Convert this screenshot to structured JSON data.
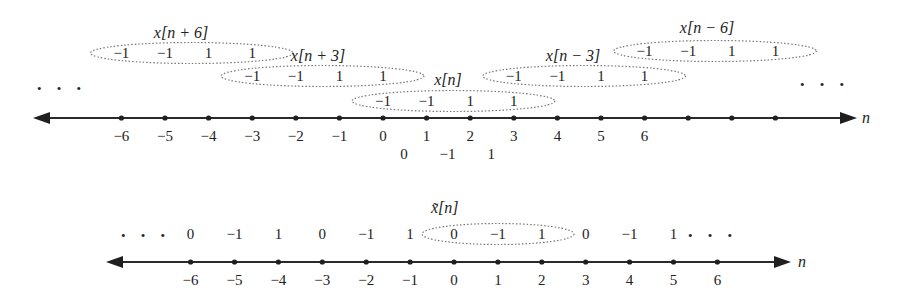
{
  "diagram": {
    "colors": {
      "ink": "#222222",
      "ellipse": "#777777",
      "background": "#ffffff"
    }
  },
  "top_axis": {
    "variable_label": "n",
    "tick_labels": [
      "−6",
      "−5",
      "−4",
      "−3",
      "−2",
      "−1",
      "0",
      "1",
      "2",
      "3",
      "4",
      "5",
      "6"
    ],
    "tick_values": [
      -6,
      -5,
      -4,
      -3,
      -2,
      -1,
      0,
      1,
      2,
      3,
      4,
      5,
      6
    ],
    "extra_unlabeled_ticks": [
      7,
      8,
      9
    ],
    "left_ellipsis": "• • •",
    "right_ellipsis": "• • •",
    "sum_row": {
      "positions": [
        0,
        1,
        2
      ],
      "values": [
        "0",
        "−1",
        "1"
      ]
    }
  },
  "shifted_copies": [
    {
      "label": "x[n + 6]",
      "start": -6,
      "values": [
        "−1",
        "−1",
        "1",
        "1"
      ]
    },
    {
      "label": "x[n + 3]",
      "start": -3,
      "values": [
        "−1",
        "−1",
        "1",
        "1"
      ]
    },
    {
      "label": "x[n]",
      "start": 0,
      "values": [
        "−1",
        "−1",
        "1",
        "1"
      ]
    },
    {
      "label": "x[n − 3]",
      "start": 3,
      "values": [
        "−1",
        "−1",
        "1",
        "1"
      ]
    },
    {
      "label": "x[n − 6]",
      "start": 6,
      "values": [
        "−1",
        "−1",
        "1",
        "1"
      ]
    }
  ],
  "bottom_axis": {
    "title": "x̃[n]",
    "variable_label": "n",
    "tick_labels": [
      "−6",
      "−5",
      "−4",
      "−3",
      "−2",
      "−1",
      "0",
      "1",
      "2",
      "3",
      "4",
      "5",
      "6"
    ],
    "tick_values": [
      -6,
      -5,
      -4,
      -3,
      -2,
      -1,
      0,
      1,
      2,
      3,
      4,
      5,
      6
    ],
    "left_ellipsis": "• • •",
    "right_ellipsis": "• • •",
    "periodic_values": [
      "0",
      "−1",
      "1",
      "0",
      "−1",
      "1",
      "0",
      "−1",
      "1",
      "0",
      "−1",
      "1"
    ],
    "periodic_positions": [
      -6,
      -5,
      -4,
      -3,
      -2,
      -1,
      0,
      1,
      2,
      3,
      4,
      5
    ],
    "highlighted_period": {
      "start": 0,
      "end": 2
    }
  }
}
